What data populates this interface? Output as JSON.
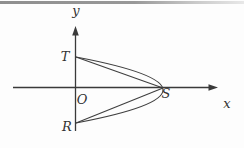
{
  "figure": {
    "kind": "coordinate-geometry-diagram",
    "axis_labels": {
      "y": "y",
      "x": "x"
    },
    "point_labels": {
      "origin": "O",
      "top_intercept": "T",
      "bottom_intercept": "R",
      "vertex": "S"
    },
    "colors": {
      "stroke": "#3a3a3a",
      "label_text": "#333333",
      "top_rule_left": "#8f8f8f",
      "top_rule_right": "#e8e8e8",
      "background": "#fdfdfd"
    }
  }
}
